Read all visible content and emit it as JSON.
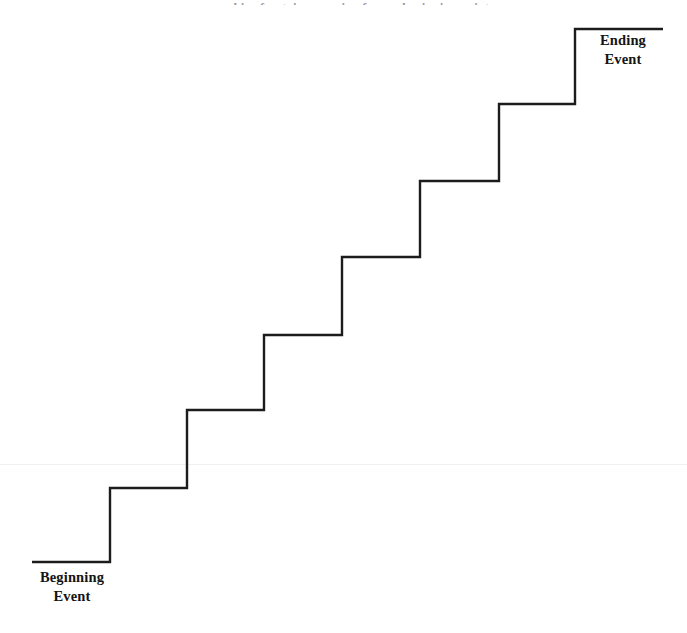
{
  "figure": {
    "type": "staircase-progression-diagram",
    "title_remnant": "a graphic of a staircase going from a beginning point",
    "background_color": "#ffffff",
    "stroke_color": "#1c1c1c",
    "stroke_width": 2.4,
    "canvas": {
      "width": 687,
      "height": 633
    }
  },
  "labels": {
    "beginning": {
      "id": "beginning-event",
      "line1": "Beginning",
      "line2": "Event",
      "position": "bottom-left"
    },
    "ending": {
      "id": "ending-event",
      "line1": "Ending",
      "line2": "Event",
      "position": "top-right"
    }
  },
  "staircase": {
    "step_count": 7,
    "direction": "ascending-left-to-right",
    "points": [
      [
        32,
        562
      ],
      [
        110,
        562
      ],
      [
        110,
        488
      ],
      [
        187,
        488
      ],
      [
        187,
        410
      ],
      [
        264,
        410
      ],
      [
        264,
        335
      ],
      [
        342,
        335
      ],
      [
        342,
        257
      ],
      [
        420,
        257
      ],
      [
        420,
        181
      ],
      [
        499,
        181
      ],
      [
        499,
        104
      ],
      [
        575,
        104
      ],
      [
        575,
        29
      ],
      [
        663,
        29
      ]
    ],
    "risers_x": [
      110,
      187,
      264,
      342,
      420,
      499,
      575
    ],
    "treads_y": [
      562,
      488,
      410,
      335,
      257,
      181,
      104,
      29
    ]
  },
  "artifacts": {
    "scan_line": {
      "y": 464,
      "color": "#f0f0f0"
    }
  }
}
